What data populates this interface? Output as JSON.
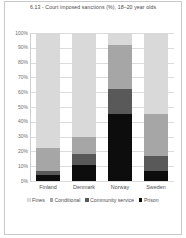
{
  "figure": {
    "title": "6.13 - Court imposed sanctions (%), 18–20 year olds"
  },
  "chart_data": {
    "type": "bar",
    "subtype": "stacked-column-100",
    "title": "6.13 - Court imposed sanctions (%), 18–20 year olds",
    "xlabel": "",
    "ylabel": "",
    "ylim": [
      0,
      100
    ],
    "yticks": [
      "0%",
      "10%",
      "20%",
      "30%",
      "40%",
      "50%",
      "60%",
      "70%",
      "80%",
      "90%",
      "100%"
    ],
    "ytick_values": [
      0,
      10,
      20,
      30,
      40,
      50,
      60,
      70,
      80,
      90,
      100
    ],
    "grid": true,
    "legend_position": "bottom",
    "categories": [
      "Finland",
      "Denmark",
      "Norway",
      "Sweden"
    ],
    "series": [
      {
        "name": "Fines",
        "color": "#d9d9d9",
        "values": [
          78,
          70,
          8,
          55
        ]
      },
      {
        "name": "Conditional",
        "color": "#a6a6a6",
        "values": [
          15,
          12,
          30,
          28
        ]
      },
      {
        "name": "Community service",
        "color": "#595959",
        "values": [
          3,
          7,
          17,
          10
        ]
      },
      {
        "name": "Prison",
        "color": "#0d0d0d",
        "values": [
          4,
          11,
          45,
          7
        ]
      }
    ]
  },
  "legend": {
    "items": [
      {
        "label": "Fines",
        "color": "#d9d9d9"
      },
      {
        "label": "Conditional",
        "color": "#a6a6a6"
      },
      {
        "label": "Community service",
        "color": "#595959"
      },
      {
        "label": "Prison",
        "color": "#0d0d0d"
      }
    ]
  }
}
